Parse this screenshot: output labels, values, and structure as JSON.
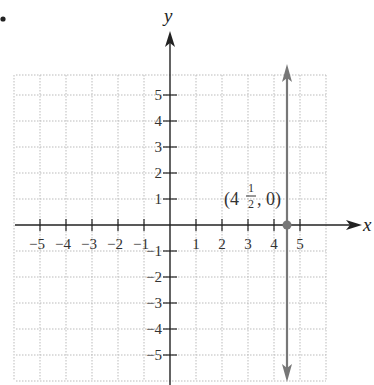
{
  "chart_data": {
    "type": "line",
    "title": "",
    "xlabel": "x",
    "ylabel": "y",
    "xlim": [
      -6,
      6
    ],
    "ylim": [
      -6,
      6
    ],
    "grid": true,
    "x_ticks": [
      -5,
      -4,
      -3,
      -2,
      -1,
      1,
      2,
      3,
      4,
      5
    ],
    "y_ticks": [
      5,
      4,
      3,
      2,
      1,
      -1,
      -2,
      -3,
      -4,
      -5
    ],
    "x_tick_labels": [
      "−5",
      "−4",
      "−3",
      "−2",
      "−1",
      "1",
      "2",
      "3",
      "4",
      "5"
    ],
    "y_tick_labels": [
      "5",
      "4",
      "3",
      "2",
      "1",
      "−1",
      "−2",
      "−3",
      "−4",
      "−5"
    ],
    "series": [
      {
        "name": "x = 4 1/2",
        "kind": "vertical-line",
        "x": 4.5,
        "y_range": [
          -6,
          6
        ],
        "color": "#777777",
        "arrows": "both"
      }
    ],
    "points": [
      {
        "x": 4.5,
        "y": 0,
        "label_whole": "4",
        "label_num": "1",
        "label_den": "2",
        "label_tail": ", 0)",
        "label_head": "(",
        "color": "#777777"
      }
    ],
    "annotations": [
      "(4½, 0)"
    ]
  },
  "labels": {
    "x_axis": "x",
    "y_axis": "y",
    "point_open": "(4",
    "point_num": "1",
    "point_den": "2",
    "point_close": ", 0)"
  },
  "colors": {
    "axis": "#222222",
    "grid": "#bbbbbb",
    "line": "#777777"
  }
}
